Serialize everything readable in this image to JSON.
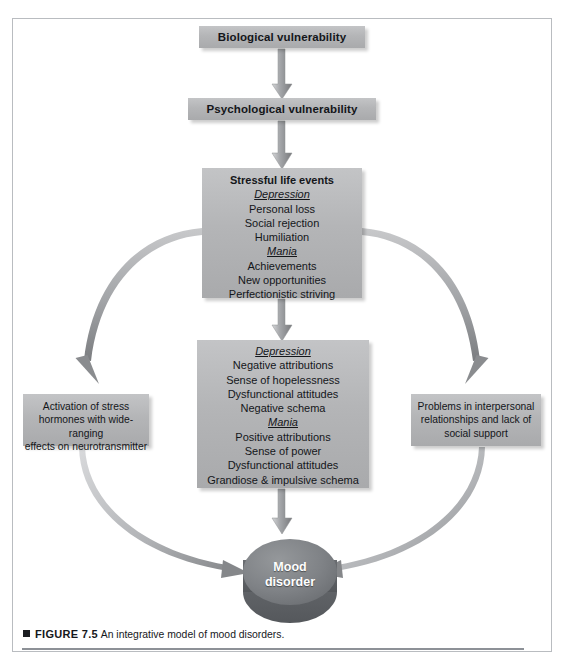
{
  "figure": {
    "number": "FIGURE 7.5",
    "caption": "An integrative model of mood disorders.",
    "marker": "black-square-bullet"
  },
  "colors": {
    "box_fill": "#b4b5b7",
    "box_fill_light": "#c3c4c6",
    "oval_fill": "#7d8084",
    "arrow_gray": "#9a9c9f",
    "frame_border": "#b9bcc0",
    "text": "#14161a",
    "oval_text": "#ffffff"
  },
  "nodes": {
    "biological": {
      "label": "Biological vulnerability"
    },
    "psychological": {
      "label": "Psychological vulnerability"
    },
    "stressful_life_events": {
      "title": "Stressful life events",
      "groups": [
        {
          "heading": "Depression",
          "items": [
            "Personal loss",
            "Social rejection",
            "Humiliation"
          ]
        },
        {
          "heading": "Mania",
          "items": [
            "Achievements",
            "New opportunities",
            "Perfectionistic striving"
          ]
        }
      ]
    },
    "cognitions": {
      "groups": [
        {
          "heading": "Depression",
          "items": [
            "Negative attributions",
            "Sense of hopelessness",
            "Dysfunctional attitudes",
            "Negative schema"
          ]
        },
        {
          "heading": "Mania",
          "items": [
            "Positive attributions",
            "Sense of power",
            "Dysfunctional attitudes",
            "Grandiose & impulsive schema"
          ]
        }
      ]
    },
    "left_effects": {
      "lines": [
        "Activation of stress",
        "hormones with wide-ranging",
        "effects on neurotransmitter"
      ]
    },
    "right_effects": {
      "lines": [
        "Problems in interpersonal",
        "relationships and lack of",
        "social support"
      ]
    },
    "outcome": {
      "lines": [
        "Mood",
        "disorder"
      ]
    }
  },
  "edges": [
    {
      "from": "biological",
      "to": "psychological",
      "style": "straight-down-arrow"
    },
    {
      "from": "psychological",
      "to": "stressful_life_events",
      "style": "straight-down-arrow"
    },
    {
      "from": "stressful_life_events",
      "to": "cognitions",
      "style": "straight-down-arrow"
    },
    {
      "from": "stressful_life_events",
      "to": "left_effects",
      "style": "curved-left-down-arrow"
    },
    {
      "from": "stressful_life_events",
      "to": "right_effects",
      "style": "curved-right-down-arrow"
    },
    {
      "from": "left_effects",
      "to": "outcome",
      "style": "curved-down-right-arrow"
    },
    {
      "from": "right_effects",
      "to": "outcome",
      "style": "curved-down-left-arrow"
    },
    {
      "from": "cognitions",
      "to": "outcome",
      "style": "straight-down-arrow"
    }
  ]
}
